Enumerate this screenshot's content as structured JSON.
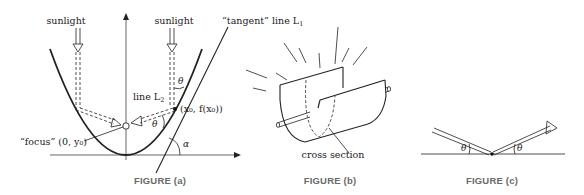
{
  "figure_a": {
    "caption": "FIGURE (a)",
    "sunlight_left": "sunlight",
    "sunlight_right": "sunlight",
    "tangent_label": "“tangent” line L",
    "tangent_sub": "1",
    "line_l2_label": "line L",
    "line_l2_sub": "2",
    "point_label": "(x₀, f(x₀))",
    "focus_label": "“focus” (0, y₀)",
    "theta_upper": "θ",
    "theta_lower": "θ",
    "alpha": "α"
  },
  "figure_b": {
    "caption": "FIGURE (b)",
    "cross_section_label": "cross section"
  },
  "figure_c": {
    "caption": "FIGURE (c)",
    "theta_left": "θ",
    "theta_right": "θ"
  },
  "colors": {
    "ink": "#222222",
    "caption_gray": "#6a6a6a",
    "background": "#ffffff"
  }
}
